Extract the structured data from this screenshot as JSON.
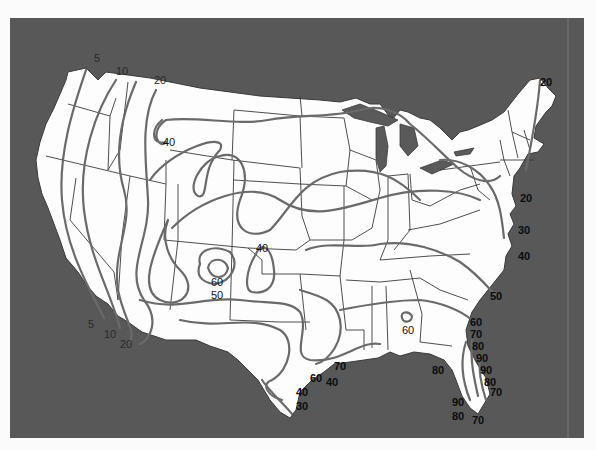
{
  "map": {
    "subject": "Contiguous United States isoline map",
    "colors": {
      "ocean": "#585858",
      "land": "#fdfdfd",
      "contour": "#6a6a6a",
      "boundary": "#3a3a3a",
      "page": "#fbfbfb"
    },
    "contour_labels": [
      {
        "id": "nw-5",
        "text": "5"
      },
      {
        "id": "nw-10",
        "text": "10"
      },
      {
        "id": "nw-20",
        "text": "20"
      },
      {
        "id": "mt-40",
        "text": "40"
      },
      {
        "id": "ne-maine-20",
        "text": "20"
      },
      {
        "id": "ne-coast-20",
        "text": "20"
      },
      {
        "id": "ne-coast-30",
        "text": "30"
      },
      {
        "id": "ne-coast-40",
        "text": "40"
      },
      {
        "id": "co-40",
        "text": "40"
      },
      {
        "id": "nm-60",
        "text": "60"
      },
      {
        "id": "nm-50",
        "text": "50"
      },
      {
        "id": "sw-5",
        "text": "5"
      },
      {
        "id": "sw-10",
        "text": "10"
      },
      {
        "id": "sw-20",
        "text": "20"
      },
      {
        "id": "se-50",
        "text": "50"
      },
      {
        "id": "se-60",
        "text": "60"
      },
      {
        "id": "al-60",
        "text": "60"
      },
      {
        "id": "fl-70a",
        "text": "70"
      },
      {
        "id": "fl-80a",
        "text": "80"
      },
      {
        "id": "fl-90a",
        "text": "90"
      },
      {
        "id": "fl-90b",
        "text": "90"
      },
      {
        "id": "fl-80b",
        "text": "80"
      },
      {
        "id": "fl-70b",
        "text": "70"
      },
      {
        "id": "gulf-80",
        "text": "80"
      },
      {
        "id": "fl-90c",
        "text": "90"
      },
      {
        "id": "fl-80c",
        "text": "80"
      },
      {
        "id": "fl-70c",
        "text": "70"
      },
      {
        "id": "la-70",
        "text": "70"
      },
      {
        "id": "tx-60",
        "text": "60"
      },
      {
        "id": "tx-40a",
        "text": "40"
      },
      {
        "id": "tx-40b",
        "text": "40"
      },
      {
        "id": "tx-30",
        "text": "30"
      }
    ]
  }
}
